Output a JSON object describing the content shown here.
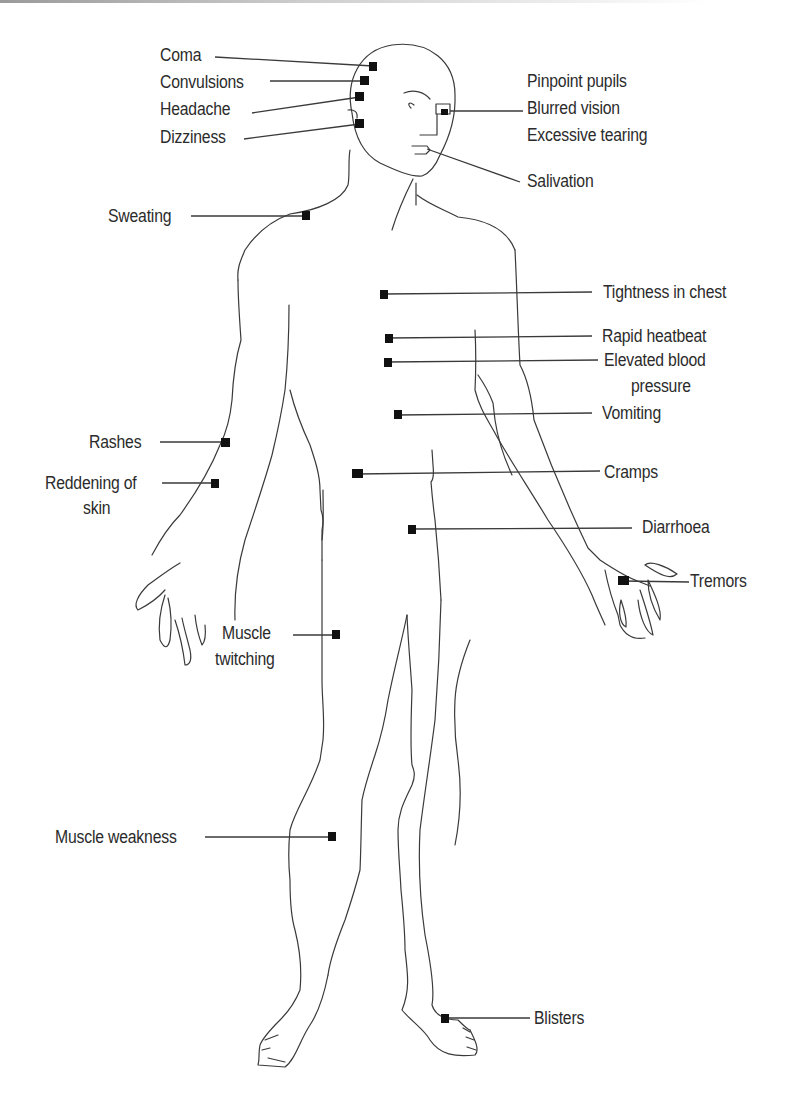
{
  "diagram": {
    "type": "anatomical-symptom-map",
    "accent_color": "#111111",
    "line_color": "#3a3a3a",
    "symptoms": {
      "head": [
        {
          "label": "Coma",
          "side": "left"
        },
        {
          "label": "Convulsions",
          "side": "left"
        },
        {
          "label": "Headache",
          "side": "left"
        },
        {
          "label": "Dizziness",
          "side": "left"
        }
      ],
      "eyes": {
        "lines": [
          "Pinpoint pupils",
          "Blurred vision",
          "Excessive tearing"
        ],
        "side": "right"
      },
      "mouth": {
        "label": "Salivation",
        "side": "right"
      },
      "shoulder": {
        "label": "Sweating",
        "side": "left"
      },
      "chest": [
        {
          "label": "Tightness in chest",
          "side": "right"
        },
        {
          "label": "Rapid heatbeat",
          "side": "right"
        },
        {
          "label": "Elevated blood",
          "label2": "pressure",
          "side": "right"
        }
      ],
      "abdomen": [
        {
          "label": "Vomiting",
          "side": "right"
        },
        {
          "label": "Cramps",
          "side": "right"
        },
        {
          "label": "Diarrhoea",
          "side": "right"
        }
      ],
      "arm": [
        {
          "label": "Rashes",
          "side": "left"
        },
        {
          "label": "Reddening of",
          "label2": "skin",
          "side": "left"
        }
      ],
      "hand": {
        "label": "Tremors",
        "side": "right"
      },
      "thigh": {
        "label": "Muscle",
        "label2": "twitching",
        "side": "left"
      },
      "shin": {
        "label": "Muscle weakness",
        "side": "left"
      },
      "foot": {
        "label": "Blisters",
        "side": "right"
      }
    }
  }
}
